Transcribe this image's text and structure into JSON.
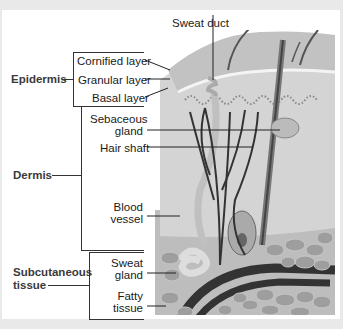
{
  "diagram": {
    "groups": [
      {
        "id": "epidermis",
        "label": "Epidermis"
      },
      {
        "id": "dermis",
        "label": "Dermis"
      },
      {
        "id": "subcutaneous",
        "label_line1": "Subcutaneous",
        "label_line2": "tissue"
      }
    ],
    "labels": {
      "sweat_duct": "Sweat duct",
      "cornified_layer": "Cornified layer",
      "granular_layer": "Granular layer",
      "basal_layer": "Basal layer",
      "sebaceous_gland_1": "Sebaceous",
      "sebaceous_gland_2": "gland",
      "hair_shaft": "Hair shaft",
      "blood_vessel_1": "Blood",
      "blood_vessel_2": "vessel",
      "sweat_gland_1": "Sweat",
      "sweat_gland_2": "gland",
      "fatty_tissue_1": "Fatty",
      "fatty_tissue_2": "tissue"
    },
    "colors": {
      "background": "#e9e9e9",
      "panel": "#ffffff",
      "skin_surface": "#c9c9c9",
      "dermis": "#d6d6d6",
      "fat": "#9a9a9a",
      "vessel": "#333333"
    }
  }
}
